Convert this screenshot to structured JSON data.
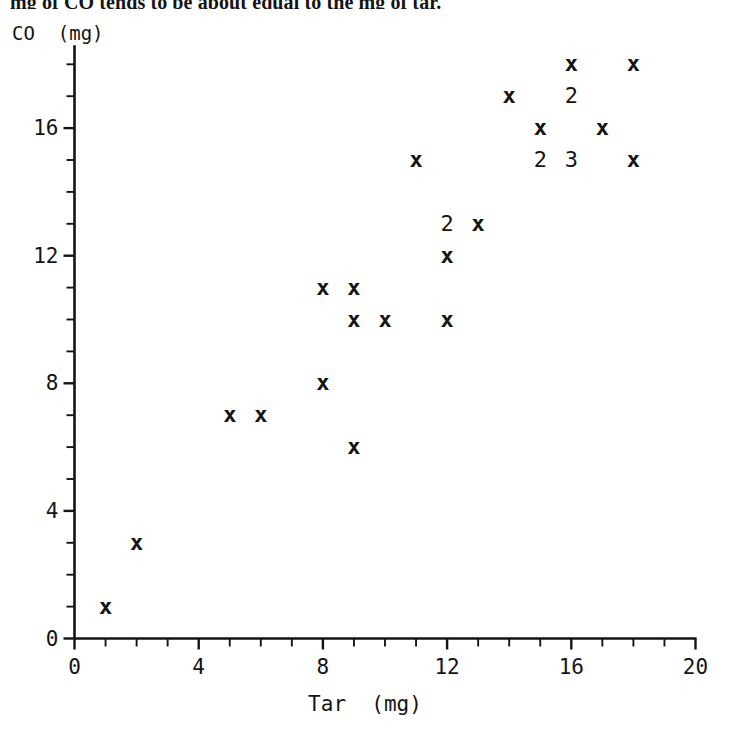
{
  "page": {
    "clipped_sentence": "mg of CO tends to be about equal to the mg of tar."
  },
  "chart_data": {
    "type": "scatter",
    "title": "",
    "xlabel": "Tar  (mg)",
    "ylabel": "CO  (mg)",
    "xlim": [
      0,
      20
    ],
    "ylim": [
      0,
      18.6
    ],
    "grid": false,
    "legend": null,
    "x_ticks_major": [
      0,
      4,
      8,
      12,
      16,
      20
    ],
    "x_tick_labels": [
      "0",
      "4",
      "8",
      "12",
      "16",
      "20"
    ],
    "x_minor_tick_step": 1,
    "y_ticks_major": [
      0,
      4,
      8,
      12,
      16
    ],
    "y_tick_labels": [
      "0",
      "4",
      "8",
      "12",
      "16"
    ],
    "y_minor_tick_step": 1,
    "marker_symbol": "x",
    "overplot_note": "Digits indicate the count of coincident points at that location",
    "points": [
      {
        "x": 1,
        "y": 1,
        "label": "x",
        "count": 1
      },
      {
        "x": 2,
        "y": 3,
        "label": "x",
        "count": 1
      },
      {
        "x": 5,
        "y": 7,
        "label": "x",
        "count": 1
      },
      {
        "x": 6,
        "y": 7,
        "label": "x",
        "count": 1
      },
      {
        "x": 8,
        "y": 8,
        "label": "x",
        "count": 1
      },
      {
        "x": 9,
        "y": 6,
        "label": "x",
        "count": 1
      },
      {
        "x": 8,
        "y": 11,
        "label": "x",
        "count": 1
      },
      {
        "x": 9,
        "y": 11,
        "label": "x",
        "count": 1
      },
      {
        "x": 9,
        "y": 10,
        "label": "x",
        "count": 1
      },
      {
        "x": 10,
        "y": 10,
        "label": "x",
        "count": 1
      },
      {
        "x": 12,
        "y": 10,
        "label": "x",
        "count": 1
      },
      {
        "x": 11,
        "y": 15,
        "label": "x",
        "count": 1
      },
      {
        "x": 12,
        "y": 12,
        "label": "x",
        "count": 1
      },
      {
        "x": 12,
        "y": 13,
        "label": "2",
        "count": 2
      },
      {
        "x": 13,
        "y": 13,
        "label": "x",
        "count": 1
      },
      {
        "x": 14,
        "y": 17,
        "label": "x",
        "count": 1
      },
      {
        "x": 15,
        "y": 16,
        "label": "x",
        "count": 1
      },
      {
        "x": 15,
        "y": 15,
        "label": "2",
        "count": 2
      },
      {
        "x": 16,
        "y": 15,
        "label": "3",
        "count": 3
      },
      {
        "x": 16,
        "y": 18,
        "label": "x",
        "count": 1
      },
      {
        "x": 16,
        "y": 17,
        "label": "2",
        "count": 2
      },
      {
        "x": 17,
        "y": 16,
        "label": "x",
        "count": 1
      },
      {
        "x": 18,
        "y": 18,
        "label": "x",
        "count": 1
      },
      {
        "x": 18,
        "y": 15,
        "label": "x",
        "count": 1
      }
    ]
  },
  "colors": {
    "ink": "#141414",
    "background": "#ffffff"
  }
}
